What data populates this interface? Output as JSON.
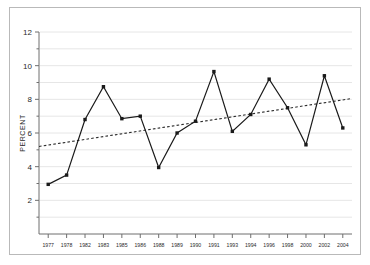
{
  "chart_data": {
    "type": "line",
    "title": "",
    "subtitle": "",
    "xlabel": "",
    "ylabel": "PERCENT",
    "categories": [
      "1977",
      "1978",
      "1982",
      "1983",
      "1985",
      "1986",
      "1988",
      "1989",
      "1990",
      "1991",
      "1993",
      "1994",
      "1996",
      "1998",
      "2000",
      "2002",
      "2004"
    ],
    "values": [
      2.95,
      3.5,
      6.8,
      8.75,
      6.85,
      7.0,
      3.95,
      6.0,
      6.7,
      9.65,
      6.1,
      7.1,
      9.2,
      7.5,
      5.3,
      9.4,
      6.3
    ],
    "series": [
      {
        "name": "Percent",
        "style": "solid-line-with-square-markers",
        "color": "#1a1a1a",
        "values": [
          2.95,
          3.5,
          6.8,
          8.75,
          6.85,
          7.0,
          3.95,
          6.0,
          6.7,
          9.65,
          6.1,
          7.1,
          9.2,
          7.5,
          5.3,
          9.4,
          6.3
        ]
      },
      {
        "name": "Trend",
        "style": "dashed-line",
        "color": "#2b2b2b",
        "values": [
          5.2,
          5.38,
          5.55,
          5.73,
          5.9,
          6.07,
          6.25,
          6.42,
          6.6,
          6.77,
          6.95,
          7.12,
          7.3,
          7.47,
          7.7,
          7.88,
          8.05
        ]
      }
    ],
    "ylim": [
      0,
      12
    ],
    "yticks": [
      2,
      4,
      6,
      8,
      10,
      12
    ],
    "ytick_labels": [
      "2",
      "4",
      "6",
      "8",
      "10",
      "12"
    ],
    "xlim_categories": 17,
    "grid": "horizontal-minor-gridlines",
    "legend": "none",
    "marker": "filled-square",
    "trend_start_value": 5.2,
    "trend_end_value": 8.05
  },
  "axis": {
    "y_title": "PERCENT"
  },
  "colors": {
    "frame": "#b9b9b9",
    "axis": "#6e6e6e",
    "gridline": "#e6e6e6",
    "series": "#1a1a1a",
    "trend": "#2b2b2b",
    "text": "#2b2b2b",
    "background": "#ffffff"
  }
}
